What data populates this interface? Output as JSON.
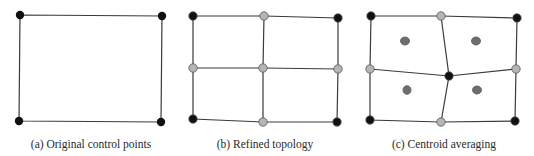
{
  "captions": {
    "a": "(a) Original control points",
    "b": "(b) Refined topology",
    "c": "(c) Centroid averaging"
  },
  "colors": {
    "line": "#3a3a3a",
    "control_point": "#111111",
    "refined_point": "#b5b5b5",
    "centroid_point": "#6e6e6e"
  },
  "panels": [
    {
      "id": "a",
      "points": [
        {
          "x": 20,
          "y": 15,
          "type": "control"
        },
        {
          "x": 162,
          "y": 16,
          "type": "control"
        },
        {
          "x": 19,
          "y": 121,
          "type": "control"
        },
        {
          "x": 161,
          "y": 122,
          "type": "control"
        }
      ]
    },
    {
      "id": "b",
      "points": [
        {
          "x": 193,
          "y": 16,
          "type": "control"
        },
        {
          "x": 264,
          "y": 16,
          "type": "refined"
        },
        {
          "x": 338,
          "y": 18,
          "type": "control"
        },
        {
          "x": 193,
          "y": 68,
          "type": "refined"
        },
        {
          "x": 263,
          "y": 68,
          "type": "refined"
        },
        {
          "x": 338,
          "y": 69,
          "type": "refined"
        },
        {
          "x": 193,
          "y": 119,
          "type": "control"
        },
        {
          "x": 263,
          "y": 122,
          "type": "refined"
        },
        {
          "x": 337,
          "y": 122,
          "type": "control"
        }
      ]
    },
    {
      "id": "c",
      "points": [
        {
          "x": 371,
          "y": 16,
          "type": "control"
        },
        {
          "x": 441,
          "y": 16,
          "type": "refined"
        },
        {
          "x": 517,
          "y": 18,
          "type": "control"
        },
        {
          "x": 370,
          "y": 69,
          "type": "refined"
        },
        {
          "x": 449,
          "y": 76,
          "type": "control"
        },
        {
          "x": 516,
          "y": 69,
          "type": "refined"
        },
        {
          "x": 370,
          "y": 120,
          "type": "control"
        },
        {
          "x": 441,
          "y": 122,
          "type": "refined"
        },
        {
          "x": 515,
          "y": 121,
          "type": "control"
        }
      ],
      "centroids": [
        {
          "x": 405,
          "y": 41
        },
        {
          "x": 476,
          "y": 41
        },
        {
          "x": 407,
          "y": 90
        },
        {
          "x": 477,
          "y": 90
        }
      ]
    }
  ]
}
